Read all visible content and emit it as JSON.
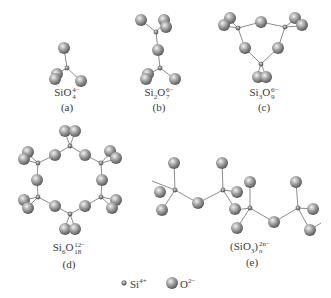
{
  "figure": {
    "type": "silicate structural units diagram",
    "panels": [
      {
        "id": "a",
        "tag": "(a)",
        "formula_base": "SiO",
        "subscript": "4",
        "superscript": "4−",
        "name": "orthosilicate tetrahedron"
      },
      {
        "id": "b",
        "tag": "(b)",
        "formula_base_1": "Si",
        "sub_1": "2",
        "formula_base_2": "O",
        "subscript": "7",
        "superscript": "6−",
        "name": "disilicate"
      },
      {
        "id": "c",
        "tag": "(c)",
        "formula_base_1": "Si",
        "sub_1": "3",
        "formula_base_2": "O",
        "subscript": "9",
        "superscript": "6−",
        "name": "three-membered ring"
      },
      {
        "id": "d",
        "tag": "(d)",
        "formula_base_1": "Si",
        "sub_1": "6",
        "formula_base_2": "O",
        "subscript": "18",
        "superscript": "12−",
        "name": "six-membered ring"
      },
      {
        "id": "e",
        "tag": "(e)",
        "formula_base": "(SiO",
        "sub_1": "3",
        "close": ")",
        "subscript": "n",
        "superscript": "2n−",
        "name": "single chain"
      }
    ],
    "legend": {
      "si": {
        "label": "Si",
        "charge": "4+"
      },
      "o": {
        "label": "O",
        "charge": "2−"
      }
    },
    "colors": {
      "oxygen_light": "#e6e6e6",
      "oxygen_dark": "#6e6e6e",
      "silicon": "#8a8a8a",
      "bond": "#707070"
    }
  }
}
